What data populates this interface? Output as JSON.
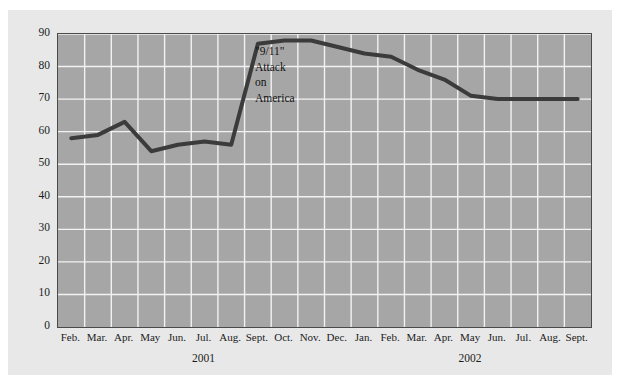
{
  "chart_data": {
    "type": "line",
    "title": "",
    "subtitle": "",
    "xlabel": "",
    "ylabel": "",
    "ylim": [
      0,
      90
    ],
    "ytick_step": 10,
    "yticks": [
      90,
      80,
      70,
      60,
      50,
      40,
      30,
      20,
      10,
      0
    ],
    "grid": true,
    "legend": "none",
    "categories": [
      "Feb.",
      "Mar.",
      "Apr.",
      "May",
      "Jun.",
      "Jul.",
      "Aug.",
      "Sept.",
      "Oct.",
      "Nov.",
      "Dec.",
      "Jan.",
      "Feb.",
      "Mar.",
      "Apr.",
      "May",
      "Jun.",
      "Jul.",
      "Aug.",
      "Sept."
    ],
    "values": [
      58,
      59,
      63,
      54,
      56,
      57,
      56,
      87,
      88,
      88,
      86,
      84,
      83,
      79,
      76,
      71,
      70,
      70,
      70,
      70
    ],
    "group_labels": [
      {
        "label": "2001",
        "start_index": 0,
        "end_index": 10
      },
      {
        "label": "2002",
        "start_index": 11,
        "end_index": 19
      }
    ],
    "annotations": [
      {
        "lines": [
          "\"9/11\"",
          "Attack",
          "on",
          "America"
        ],
        "anchor_category": "Sept.",
        "anchor_value": 87
      }
    ],
    "colors": {
      "page_background": "#ffffff",
      "panel_background": "#e8e8e8",
      "plot_background": "#a6a6a6",
      "plot_border": "#4a4a4a",
      "gridlines": "#f2f2f2",
      "line_series": "#3b3b3b",
      "text": "#1c1c1c"
    },
    "line_width_px": 4
  }
}
